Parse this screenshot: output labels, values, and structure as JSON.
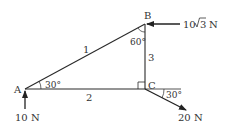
{
  "diagram": {
    "type": "truss",
    "nodes": {
      "A": {
        "label": "A"
      },
      "B": {
        "label": "B"
      },
      "C": {
        "label": "C"
      }
    },
    "members": [
      {
        "id": "1",
        "label": "1",
        "from": "A",
        "to": "B"
      },
      {
        "id": "2",
        "label": "2",
        "from": "A",
        "to": "C"
      },
      {
        "id": "3",
        "label": "3",
        "from": "C",
        "to": "B"
      }
    ],
    "angles": {
      "at_A": "30°",
      "at_B": "60°",
      "at_C_force": "30°"
    },
    "forces": {
      "at_A": {
        "label": "10 N",
        "direction": "up"
      },
      "at_B": {
        "label_prefix": "10",
        "label_root": "3",
        "label_unit": "N",
        "direction": "left"
      },
      "at_C": {
        "label": "20 N",
        "direction": "down-right 30° below horizontal"
      }
    },
    "right_angle_at": "C",
    "color": "#2a2a2a"
  }
}
